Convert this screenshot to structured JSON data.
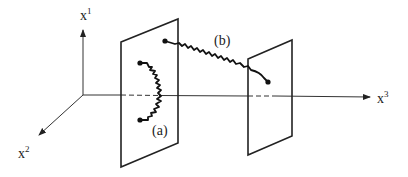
{
  "diagram": {
    "axes": {
      "x1": {
        "base": "x",
        "sup": "1"
      },
      "x2": {
        "base": "x",
        "sup": "2"
      },
      "x3": {
        "base": "x",
        "sup": "3"
      }
    },
    "strings": {
      "a": {
        "label": "(a)"
      },
      "b": {
        "label": "(b)"
      }
    },
    "colors": {
      "line": "#222222",
      "background": "#ffffff"
    }
  }
}
